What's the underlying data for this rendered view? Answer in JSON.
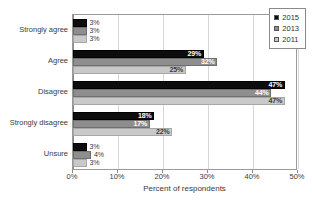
{
  "chart_data": {
    "type": "bar",
    "orientation": "horizontal",
    "title": "",
    "xlabel": "Percent of respondents",
    "ylabel": "",
    "xlim": [
      0,
      50
    ],
    "xticks": [
      "0%",
      "10%",
      "20%",
      "30%",
      "40%",
      "50%"
    ],
    "xtick_values": [
      0,
      10,
      20,
      30,
      40,
      50
    ],
    "grid": true,
    "legend_position": "top-right",
    "categories": [
      "Strongly agree",
      "Agree",
      "Disagree",
      "Strongly disagree",
      "Unsure"
    ],
    "series": [
      {
        "name": "2015",
        "color": "#0d0d0d",
        "values": [
          3,
          29,
          47,
          18,
          3
        ],
        "labels": [
          "3%",
          "29%",
          "47%",
          "18%",
          "3%"
        ]
      },
      {
        "name": "2013",
        "color": "#8e8e8e",
        "values": [
          3,
          32,
          44,
          17,
          4
        ],
        "labels": [
          "3%",
          "32%",
          "44%",
          "17%",
          "4%"
        ]
      },
      {
        "name": "2011",
        "color": "#c9c9c9",
        "values": [
          3,
          25,
          47,
          22,
          3
        ],
        "labels": [
          "3%",
          "25%",
          "47%",
          "22%",
          "3%"
        ]
      }
    ]
  },
  "legend": {
    "items": [
      {
        "label": "2015",
        "color": "#0d0d0d"
      },
      {
        "label": "2013",
        "color": "#8e8e8e"
      },
      {
        "label": "2011",
        "color": "#c9c9c9"
      }
    ]
  },
  "axis": {
    "x_title": "Percent of respondents"
  }
}
